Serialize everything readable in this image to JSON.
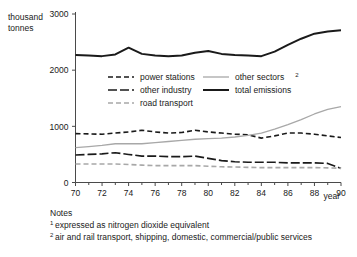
{
  "chart_data": {
    "type": "line",
    "title": "",
    "xlabel": "year",
    "ylabel": "thousand tonnes",
    "ylabel_line1": "thousand",
    "ylabel_line2": "tonnes",
    "xlim": [
      70,
      90
    ],
    "ylim": [
      0,
      3000
    ],
    "grid": false,
    "legend_position": "inside-upper-middle",
    "y_ticks": [
      "0",
      "1000",
      "2000",
      "3000"
    ],
    "y_tick_values": [
      0,
      1000,
      2000,
      3000
    ],
    "x_ticks": [
      "70",
      "72",
      "74",
      "76",
      "78",
      "80",
      "82",
      "84",
      "86",
      "88",
      "90"
    ],
    "x_tick_values": [
      70,
      72,
      74,
      76,
      78,
      80,
      82,
      84,
      86,
      88,
      90
    ],
    "x": [
      70,
      71,
      72,
      73,
      74,
      75,
      76,
      77,
      78,
      79,
      80,
      81,
      82,
      83,
      84,
      85,
      86,
      87,
      88,
      89,
      90
    ],
    "series": [
      {
        "name": "power stations",
        "style": "short-dash",
        "color": "#1a1a1a",
        "width": 1.6,
        "dasharray": "5,3",
        "values": [
          870,
          865,
          860,
          880,
          900,
          930,
          900,
          880,
          890,
          930,
          900,
          880,
          860,
          850,
          790,
          830,
          880,
          880,
          860,
          830,
          800
        ]
      },
      {
        "name": "other industry",
        "style": "long-dash",
        "color": "#1a1a1a",
        "width": 1.6,
        "dasharray": "9,3",
        "values": [
          490,
          500,
          510,
          530,
          500,
          470,
          470,
          460,
          460,
          470,
          430,
          390,
          370,
          360,
          360,
          360,
          350,
          350,
          350,
          340,
          250
        ]
      },
      {
        "name": "road transport",
        "style": "short-dash-grey",
        "color": "#a8a8a8",
        "width": 1.6,
        "dasharray": "5,3",
        "values": [
          330,
          330,
          330,
          330,
          320,
          310,
          300,
          300,
          300,
          300,
          290,
          280,
          275,
          270,
          265,
          265,
          265,
          265,
          265,
          260,
          255
        ]
      },
      {
        "name": "other sectors",
        "style": "solid-grey",
        "color": "#a8a8a8",
        "width": 1.3,
        "dasharray": "",
        "values": [
          620,
          640,
          660,
          690,
          690,
          690,
          710,
          730,
          750,
          770,
          780,
          790,
          810,
          840,
          880,
          950,
          1030,
          1120,
          1220,
          1300,
          1350
        ]
      },
      {
        "name": "total emissions",
        "style": "solid-black",
        "color": "#1a1a1a",
        "width": 2.0,
        "dasharray": "",
        "values": [
          2270,
          2260,
          2250,
          2280,
          2400,
          2290,
          2260,
          2250,
          2260,
          2310,
          2340,
          2290,
          2270,
          2260,
          2250,
          2330,
          2450,
          2560,
          2650,
          2690,
          2710
        ]
      }
    ]
  },
  "legend": {
    "entries": [
      {
        "label": "power stations",
        "sup": ""
      },
      {
        "label": "other industry",
        "sup": ""
      },
      {
        "label": "road transport",
        "sup": ""
      },
      {
        "label": "other sectors",
        "sup": "2"
      },
      {
        "label": "total emissions",
        "sup": ""
      }
    ]
  },
  "notes": {
    "heading": "Notes",
    "items": [
      {
        "marker": "1",
        "text": "expressed as nitrogen dioxide equivalent"
      },
      {
        "marker": "2",
        "text": "air and rail transport, shipping, domestic, commercial/public services"
      }
    ]
  }
}
